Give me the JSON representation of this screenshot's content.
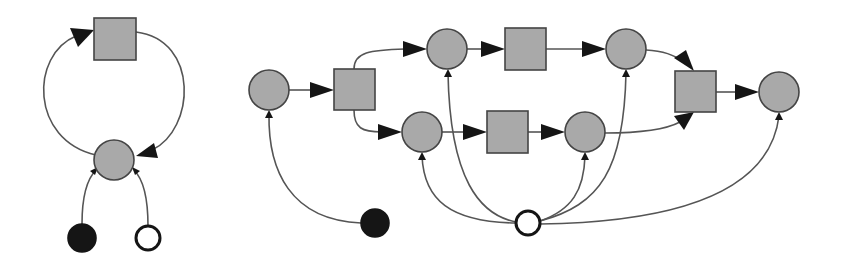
{
  "diagrams": [
    {
      "id": "left-cycle",
      "nodes": [
        {
          "id": "L-sq",
          "shape": "square",
          "fill": "gray",
          "x": 94,
          "y": 18,
          "w": 42,
          "h": 42
        },
        {
          "id": "L-c",
          "shape": "circle",
          "fill": "gray",
          "cx": 114,
          "cy": 160,
          "r": 20
        },
        {
          "id": "L-black",
          "shape": "circle",
          "fill": "black",
          "cx": 82,
          "cy": 238,
          "r": 14
        },
        {
          "id": "L-white",
          "shape": "circle",
          "fill": "white",
          "cx": 148,
          "cy": 238,
          "r": 12
        }
      ],
      "edges": [
        {
          "from": "L-c",
          "to": "L-sq"
        },
        {
          "from": "L-sq",
          "to": "L-c"
        },
        {
          "from": "L-black",
          "to": "L-c"
        },
        {
          "from": "L-white",
          "to": "L-c"
        }
      ]
    },
    {
      "id": "right-pipeline",
      "nodes": [
        {
          "id": "c1",
          "shape": "circle",
          "fill": "gray",
          "cx": 269,
          "cy": 90,
          "r": 20
        },
        {
          "id": "s1",
          "shape": "square",
          "fill": "gray",
          "x": 334,
          "y": 69,
          "w": 41,
          "h": 41
        },
        {
          "id": "c2",
          "shape": "circle",
          "fill": "gray",
          "cx": 447,
          "cy": 49,
          "r": 20
        },
        {
          "id": "s2",
          "shape": "square",
          "fill": "gray",
          "x": 505,
          "y": 28,
          "w": 41,
          "h": 42
        },
        {
          "id": "c3",
          "shape": "circle",
          "fill": "gray",
          "cx": 626,
          "cy": 49,
          "r": 20
        },
        {
          "id": "c4",
          "shape": "circle",
          "fill": "gray",
          "cx": 422,
          "cy": 132,
          "r": 20
        },
        {
          "id": "s3",
          "shape": "square",
          "fill": "gray",
          "x": 487,
          "y": 111,
          "w": 41,
          "h": 42
        },
        {
          "id": "c5",
          "shape": "circle",
          "fill": "gray",
          "cx": 585,
          "cy": 132,
          "r": 20
        },
        {
          "id": "s4",
          "shape": "square",
          "fill": "gray",
          "x": 675,
          "y": 71,
          "w": 41,
          "h": 41
        },
        {
          "id": "c6",
          "shape": "circle",
          "fill": "gray",
          "cx": 779,
          "cy": 92,
          "r": 20
        },
        {
          "id": "black",
          "shape": "circle",
          "fill": "black",
          "cx": 375,
          "cy": 223,
          "r": 14
        },
        {
          "id": "white",
          "shape": "circle",
          "fill": "white",
          "cx": 528,
          "cy": 223,
          "r": 12
        }
      ],
      "edges": [
        {
          "from": "c1",
          "to": "s1"
        },
        {
          "from": "s1",
          "to": "c2"
        },
        {
          "from": "s1",
          "to": "c4"
        },
        {
          "from": "c2",
          "to": "s2"
        },
        {
          "from": "s2",
          "to": "c3"
        },
        {
          "from": "c4",
          "to": "s3"
        },
        {
          "from": "s3",
          "to": "c5"
        },
        {
          "from": "c3",
          "to": "s4"
        },
        {
          "from": "c5",
          "to": "s4"
        },
        {
          "from": "s4",
          "to": "c6"
        },
        {
          "from": "black",
          "to": "c1"
        },
        {
          "from": "white",
          "to": "c4"
        },
        {
          "from": "white",
          "to": "c2"
        },
        {
          "from": "white",
          "to": "c5"
        },
        {
          "from": "white",
          "to": "c3"
        },
        {
          "from": "white",
          "to": "c6"
        }
      ]
    }
  ],
  "colors": {
    "node_gray": "#a9a9a9",
    "node_stroke": "#444444",
    "edge": "#555555",
    "black": "#151515",
    "background": "#ffffff"
  }
}
